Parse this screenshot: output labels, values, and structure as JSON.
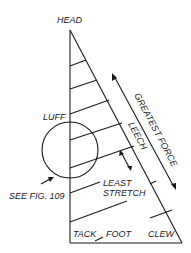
{
  "diagram": {
    "labels": {
      "head": "HEAD",
      "luff": "LUFF",
      "leech": "LEECH",
      "greatest_force": "GREATEST FORCE",
      "least_stretch_line1": "LEAST",
      "least_stretch_line2": "STRETCH",
      "see_fig": "SEE FIG. 109",
      "tack": "TACK",
      "foot": "FOOT",
      "clew": "CLEW"
    },
    "colors": {
      "ink": "#1a1a1a",
      "background": "#ffffff"
    }
  }
}
